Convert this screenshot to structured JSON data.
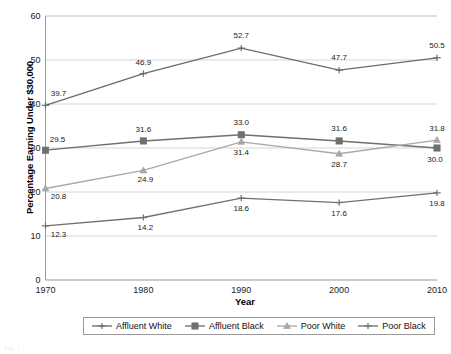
{
  "chart_data": {
    "type": "line",
    "title": "",
    "xlabel": "Year",
    "ylabel": "Percentage Earning Under $30,000",
    "categories": [
      "1970",
      "1980",
      "1990",
      "2000",
      "2010"
    ],
    "x": [
      1970,
      1980,
      1990,
      2000,
      2010
    ],
    "ylim": [
      0,
      60
    ],
    "yticks": [
      "0",
      "10",
      "20",
      "30",
      "40",
      "50",
      "60"
    ],
    "ytick_values": [
      0,
      10,
      20,
      30,
      40,
      50,
      60
    ],
    "grid": "horizontal",
    "legend_position": "bottom",
    "series": [
      {
        "name": "Affluent White",
        "color": "#6b6b6b",
        "marker": "cross",
        "values": [
          39.7,
          46.9,
          52.7,
          47.7,
          50.5
        ],
        "labels": [
          "39.7",
          "46.9",
          "52.7",
          "47.7",
          "50.5"
        ]
      },
      {
        "name": "Affluent Black",
        "color": "#6f6f6f",
        "marker": "square",
        "values": [
          29.5,
          31.6,
          33.0,
          31.6,
          30.0
        ],
        "labels": [
          "29.5",
          "31.6",
          "33.0",
          "31.6",
          "30.0"
        ]
      },
      {
        "name": "Poor White",
        "color": "#a8a8a8",
        "marker": "triangle",
        "values": [
          20.8,
          24.9,
          31.4,
          28.7,
          31.8
        ],
        "labels": [
          "20.8",
          "24.9",
          "31.4",
          "28.7",
          "31.8"
        ]
      },
      {
        "name": "Poor Black",
        "color": "#707070",
        "marker": "cross",
        "values": [
          12.3,
          14.2,
          18.6,
          17.6,
          19.8
        ],
        "labels": [
          "12.3",
          "14.2",
          "18.6",
          "17.6",
          "19.8"
        ]
      }
    ]
  },
  "legend": {
    "items": [
      {
        "label": "Affluent White"
      },
      {
        "label": "Affluent Black"
      },
      {
        "label": "Poor White"
      },
      {
        "label": "Poor Black"
      }
    ]
  },
  "axes": {
    "y_title": "Percentage Earning Under $30,000",
    "x_title": "Year"
  },
  "caption": {
    "text": "Fig. 1"
  }
}
